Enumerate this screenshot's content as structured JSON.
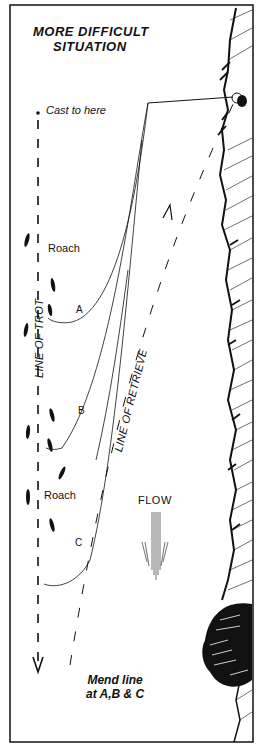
{
  "title": {
    "line1": "MORE DIFFICULT",
    "line2": "SITUATION"
  },
  "labels": {
    "cast_point": "Cast to here",
    "roach_upper": "Roach",
    "roach_lower": "Roach",
    "point_a": "A",
    "point_b": "B",
    "point_c": "C",
    "line_of_trot": "LINE OF TROT",
    "line_of_retrieve": "LINE OF RETRIEVE",
    "flow": "FLOW"
  },
  "note": {
    "line1": "Mend line",
    "line2": "at A,B & C"
  },
  "colors": {
    "ink": "#111111",
    "background": "#ffffff"
  }
}
